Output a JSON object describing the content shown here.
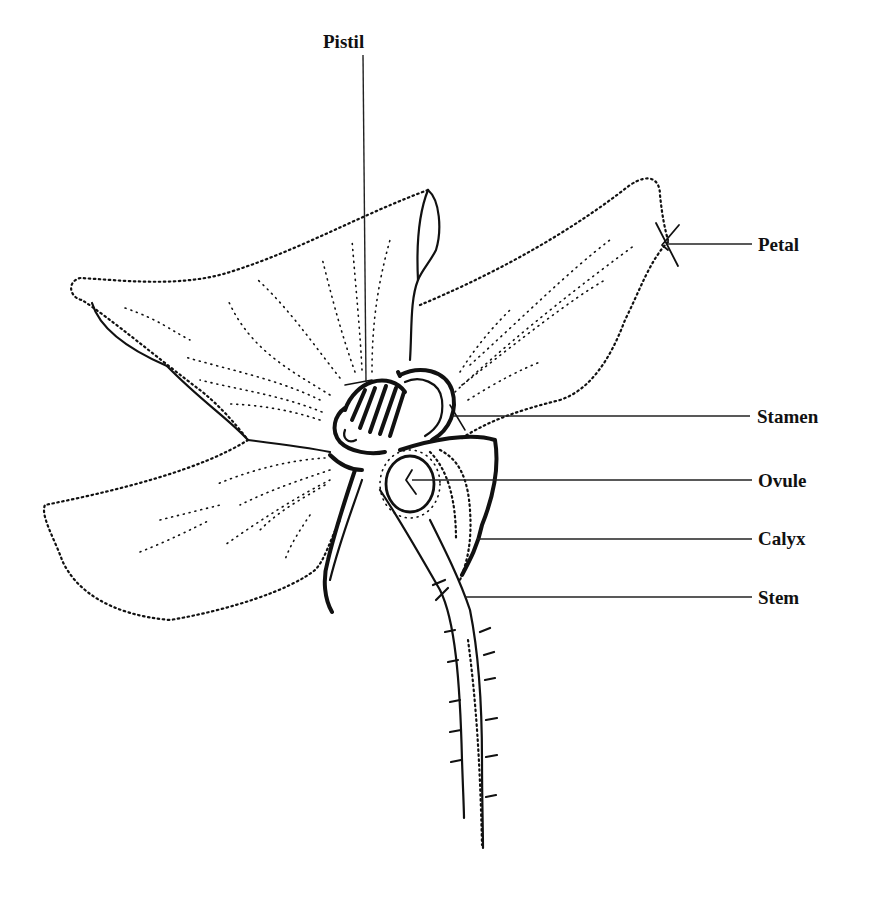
{
  "figure": {
    "type": "labeled botanical line drawing",
    "background_color": "#ffffff",
    "ink_color": "#111111"
  },
  "labels": {
    "pistil": "Pistil",
    "petal": "Petal",
    "stamen": "Stamen",
    "ovule": "Ovule",
    "calyx": "Calyx",
    "stem": "Stem"
  }
}
